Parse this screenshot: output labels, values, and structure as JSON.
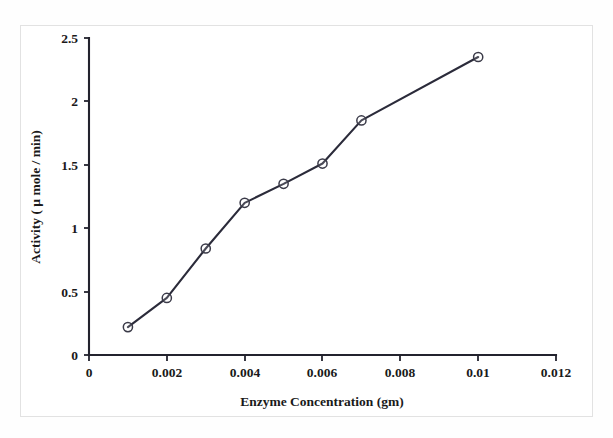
{
  "chart_data": {
    "type": "line",
    "title": "",
    "xlabel": "Enzyme Concentration (gm)",
    "ylabel": "Activity ( µ mole / min)",
    "x": [
      0.001,
      0.002,
      0.003,
      0.004,
      0.005,
      0.006,
      0.007,
      0.01
    ],
    "values": [
      0.22,
      0.45,
      0.84,
      1.2,
      1.35,
      1.51,
      1.85,
      2.35
    ],
    "series": [
      {
        "name": "Activity",
        "values": [
          0.22,
          0.45,
          0.84,
          1.2,
          1.35,
          1.51,
          1.85,
          2.35
        ]
      }
    ],
    "xlim": [
      0,
      0.012
    ],
    "ylim": [
      0,
      2.5
    ],
    "xticks": [
      0,
      0.002,
      0.004,
      0.006,
      0.008,
      0.01,
      0.012
    ],
    "xtick_labels": [
      "0",
      "0.002",
      "0.004",
      "0.006",
      "0.008",
      "0.01",
      "0.012"
    ],
    "yticks": [
      0,
      0.5,
      1,
      1.5,
      2,
      2.5
    ],
    "ytick_labels": [
      "0",
      "0.5",
      "1",
      "1.5",
      "2",
      "2.5"
    ],
    "grid": false,
    "legend": false,
    "marker": "open-circle",
    "line_color": "#2b2b3a",
    "marker_color": "#3a3a48"
  },
  "figure": {
    "background_color": "#ffffff",
    "border_color": "#e2e2e2"
  },
  "caption_fragment": {
    "text": "—"
  }
}
